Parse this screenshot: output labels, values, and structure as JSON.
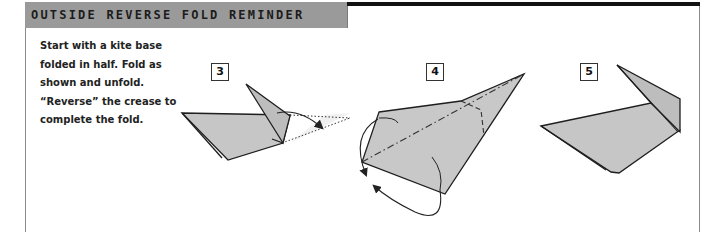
{
  "header": {
    "title": "OUTSIDE REVERSE FOLD REMINDER"
  },
  "instructions": {
    "lines": [
      "Start with a kite base",
      "folded in half. Fold as",
      "shown and unfold.",
      "“Reverse” the crease to",
      "complete the fold."
    ]
  },
  "steps": [
    {
      "number": "3",
      "description": "kite base folded in half with tip folded forward, arrow showing fold"
    },
    {
      "number": "4",
      "description": "unfolded shape with dash-dot crease line and circular reverse arrows"
    },
    {
      "number": "5",
      "description": "completed outside reverse fold"
    }
  ],
  "colors": {
    "title_bar": "#9a9a9a",
    "top_rule": "#111111",
    "paper_fill": "#c8c8c8",
    "paper_light": "#dcdcdc",
    "line": "#222222"
  }
}
